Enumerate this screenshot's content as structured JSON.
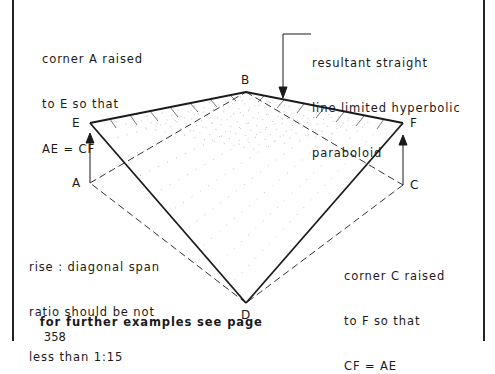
{
  "annotations": {
    "corner_a": [
      "corner A raised",
      "to E so that",
      "AE = CF"
    ],
    "resultant": [
      "resultant straight",
      "line limited hyperbolic",
      "paraboloid"
    ],
    "ratio": [
      "rise : diagonal span",
      "ratio should be not",
      "less than 1:15"
    ],
    "corner_c": [
      "corner C raised",
      "to F so that",
      "CF = AE"
    ],
    "footer": "for further examples see page",
    "footer_page": "358"
  },
  "points": {
    "A": "A",
    "B": "B",
    "C": "C",
    "D": "D",
    "E": "E",
    "F": "F"
  },
  "colors": {
    "ink": "#1a1a1a",
    "background": "#ffffff"
  }
}
